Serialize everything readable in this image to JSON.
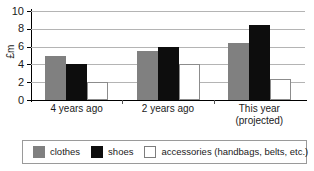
{
  "chart_data": {
    "type": "bar",
    "title": "",
    "xlabel": "",
    "ylabel": "£m",
    "ylim": [
      0,
      10
    ],
    "yticks": [
      0,
      2,
      4,
      6,
      8,
      10
    ],
    "grid": true,
    "legend_position": "bottom",
    "categories": [
      "4 years ago",
      "2 years ago",
      "This year\n(projected)"
    ],
    "series": [
      {
        "name": "clothes",
        "color": "#808080",
        "values": [
          4.9,
          5.5,
          6.4
        ]
      },
      {
        "name": "shoes",
        "color": "#0d0d0d",
        "values": [
          4.0,
          6.0,
          8.4
        ]
      },
      {
        "name": "accessories (handbags, belts, etc.)",
        "color": "#ffffff",
        "values": [
          2.0,
          4.0,
          2.4
        ]
      }
    ]
  },
  "axis": {
    "y_title": "£m",
    "tick_labels": [
      "10",
      "8",
      "6",
      "4",
      "2",
      "0"
    ]
  },
  "x_labels": {
    "g0": "4 years ago",
    "g1": "2 years ago",
    "g2": "This year\n(projected)"
  },
  "legend": {
    "items": [
      {
        "label": "clothes"
      },
      {
        "label": "shoes"
      },
      {
        "label": "accessories (handbags, belts, etc.)"
      }
    ]
  }
}
